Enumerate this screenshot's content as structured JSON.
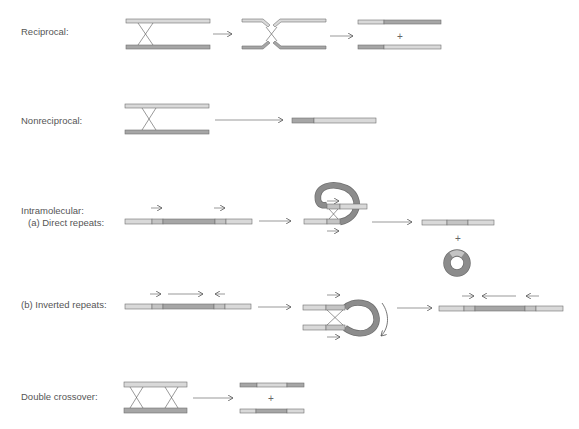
{
  "colors": {
    "light_bar": "#d9d9d9",
    "dark_bar": "#a6a6a6",
    "bar_stroke": "#707070",
    "ring": "#8c8c8c",
    "line": "#555555",
    "text": "#555555"
  },
  "labels": {
    "reciprocal": "Reciprocal:",
    "nonreciprocal": "Nonreciprocal:",
    "intramolecular": "Intramolecular:",
    "direct_repeats": "(a) Direct repeats:",
    "inverted_repeats": "(b) Inverted repeats:",
    "double_crossover": "Double crossover:"
  },
  "symbols": {
    "plus": "+"
  }
}
